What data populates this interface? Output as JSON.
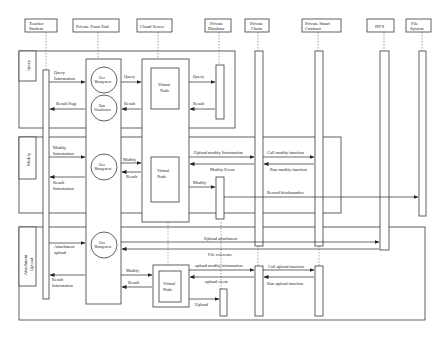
{
  "participants": [
    {
      "id": "teacher",
      "label_lines": [
        "Teacher",
        "Student"
      ]
    },
    {
      "id": "frontend",
      "label_lines": [
        "Private Front End"
      ]
    },
    {
      "id": "cloud",
      "label_lines": [
        "Cloud Server"
      ]
    },
    {
      "id": "database",
      "label_lines": [
        "Private",
        "Database"
      ]
    },
    {
      "id": "chain",
      "label_lines": [
        "Private",
        "Chain"
      ]
    },
    {
      "id": "contract",
      "label_lines": [
        "Private Smart",
        "Contract"
      ]
    },
    {
      "id": "ipfs",
      "label_lines": [
        "IPFS"
      ]
    },
    {
      "id": "filesystem",
      "label_lines": [
        "File",
        "System"
      ]
    }
  ],
  "frames": {
    "query": {
      "label": "Query"
    },
    "modify": {
      "label": "Modify"
    },
    "upload": {
      "label_lines": [
        "Attachment",
        "Upload"
      ]
    }
  },
  "components": {
    "user_mgmt": [
      "User",
      "Management"
    ],
    "data_vis": [
      "Data",
      "Visualization"
    ],
    "virtual_node": [
      "Virtual",
      "Node"
    ]
  },
  "messages": {
    "query_info": [
      "Query",
      "Information"
    ],
    "query_fe_cloud": "Query",
    "query_cloud_db": "Query",
    "result_page": "Result Page",
    "result_cloud_fe": "Result",
    "result_db_cloud": "Result",
    "modify_info": [
      "Modify",
      "Information"
    ],
    "modify_fe_cloud": "Modify",
    "result_modify": "Result",
    "upload_modify_info": "Upload modify Information",
    "call_modify_function": "Call modify function",
    "modify_event": "Modify Event",
    "run_modify_function": "Run modify function",
    "modify_cloud_db": "Modify",
    "record_blocknumber": "Record blocknumber",
    "result_info_modify": [
      "Result",
      "Information"
    ],
    "attachment_upload": [
      "Attachment",
      "upload"
    ],
    "upload_attachment": "Upload attachment",
    "file_reference": "File reference",
    "modify_upload": "Modify",
    "result_upload": "Result",
    "upload_modify_information_2": "upload modify information",
    "call_upload_function": "Call upload function",
    "upload_event": "upload event",
    "run_upload_function": "Run upload function",
    "upload_db": "Upload",
    "result_info_upload": [
      "Result",
      "Information"
    ]
  }
}
